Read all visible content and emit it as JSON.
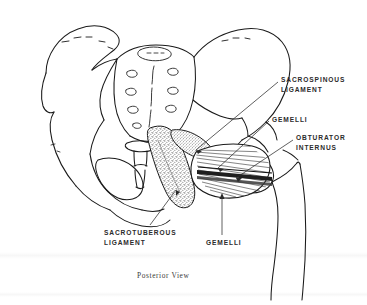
{
  "figure": {
    "title": "Posterior View",
    "view": "Posterior View",
    "background_color": "#ffffff",
    "line_color": "#1a1a1a",
    "text_color": "#2b2b2b"
  },
  "caption": {
    "text": "Posterior View"
  },
  "labels": [
    {
      "id": "sacrospinous",
      "line1": "SACROSPINOUS",
      "line2": "LIGAMENT",
      "text": "SACROSPINOUS LIGAMENT"
    },
    {
      "id": "gemelli-top",
      "line1": "GEMELLI",
      "line2": "",
      "text": "GEMELLI"
    },
    {
      "id": "obturator",
      "line1": "OBTURATOR",
      "line2": "INTERNUS",
      "text": "OBTURATOR INTERNUS"
    },
    {
      "id": "sacrotuberous",
      "line1": "SACROTUBEROUS",
      "line2": "LIGAMENT",
      "text": "SACROTUBEROUS LIGAMENT"
    },
    {
      "id": "gemelli-bottom",
      "line1": "GEMELLI",
      "line2": "",
      "text": "GEMELLI"
    }
  ],
  "structures": {
    "left_ilium": "left-iliac-wing",
    "right_ilium": "right-iliac-wing",
    "sacrum": "sacrum",
    "coccyx": "coccyx",
    "left_ischium": "left-ischium",
    "right_femur": "right-femur",
    "obturator_foramen": "obturator-foramen",
    "sacrotuberous_ligament": "sacrotuberous-ligament",
    "sacrospinous_ligament": "sacrospinous-ligament",
    "obturator_internus_muscle": "obturator-internus-muscle",
    "gemelli_muscles": "gemelli-muscles"
  }
}
